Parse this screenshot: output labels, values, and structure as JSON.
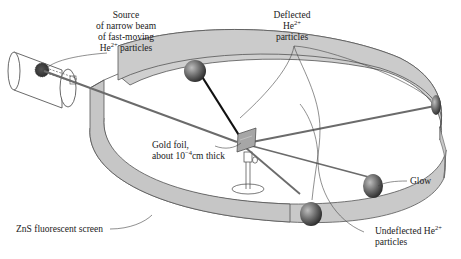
{
  "diagram": {
    "colors": {
      "screen_fill": "#c9c9c9",
      "screen_outline": "#555555",
      "beam": "#6b6b6b",
      "dark_beam": "#111111",
      "glow_spot": "#5a5a5a",
      "background": "#ffffff"
    },
    "labels": {
      "source": {
        "line1": "Source",
        "line2": "of narrow beam",
        "line3": "of fast-moving",
        "line4_prefix": "He",
        "line4_sup": "2+",
        "line4_suffix": " particles"
      },
      "deflected": {
        "line1": "Deflected",
        "line2_prefix": "He",
        "line2_sup": "2+",
        "line3": "particles"
      },
      "gold_foil": {
        "line1": "Gold foil,",
        "line2_prefix": "about 10",
        "line2_sup": "−4",
        "line2_suffix": "cm thick"
      },
      "glow": "Glow",
      "zns_screen": "ZnS fluorescent screen",
      "undeflected": {
        "line1_prefix": "Undeflected He",
        "line1_sup": "2+",
        "line2": "particles"
      }
    },
    "components": [
      "alpha-particle-source",
      "beam",
      "gold-foil",
      "foil-stand",
      "zns-fluorescent-screen",
      "glow-spots",
      "deflected-rays",
      "undeflected-ray"
    ]
  }
}
